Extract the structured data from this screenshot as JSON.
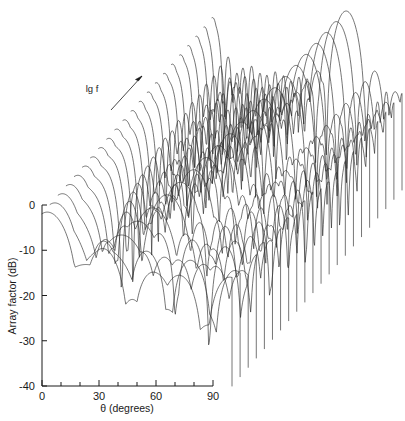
{
  "figure": {
    "title": "",
    "background_color": "#ffffff",
    "line_color": "#2b2b2b",
    "text_color": "#1a1a1a",
    "width": 405,
    "height": 421
  },
  "axes": {
    "x": {
      "label": "θ (degrees)",
      "ticks_major": [
        0,
        30,
        60,
        90
      ],
      "tick_labels": [
        "0",
        "30",
        "60",
        "90"
      ],
      "minor_tick_step": 10,
      "range": [
        0,
        100
      ]
    },
    "y": {
      "label": "Array factor (dB)",
      "ticks_major": [
        0,
        -10,
        -20,
        -30,
        -40
      ],
      "tick_labels": [
        "0",
        "-10",
        "-20",
        "-30",
        "-40"
      ],
      "range": [
        -40,
        0
      ]
    },
    "z": {
      "label": "lg f",
      "arrow": "up-right-arrow",
      "direction": "increasing"
    }
  },
  "chart_data": {
    "type": "line",
    "variant": "waterfall-3d-ridge",
    "title": "",
    "xlabel": "θ (degrees)",
    "ylabel": "Array factor (dB)",
    "zlabel": "lg f",
    "xlim": [
      0,
      100
    ],
    "ylim": [
      -40,
      0
    ],
    "grid": false,
    "legend": "none",
    "n_traces": 22,
    "clip_floor_db": -40,
    "x": [
      0,
      2,
      4,
      6,
      8,
      10,
      12,
      14,
      16,
      18,
      20,
      22,
      24,
      26,
      28,
      30,
      32,
      34,
      36,
      38,
      40,
      42,
      44,
      46,
      48,
      50,
      52,
      54,
      56,
      58,
      60,
      62,
      64,
      66,
      68,
      70,
      72,
      74,
      76,
      78,
      80,
      82,
      84,
      86,
      88,
      90,
      92,
      94,
      96,
      98,
      100
    ],
    "series": [
      {
        "name": "lg f = 0 (front)",
        "lobe_count": 3,
        "main_lobe_theta": 0,
        "first_null_theta": 22
      },
      {
        "name": "lg f = 1",
        "lobe_count": 4,
        "main_lobe_theta": 0,
        "first_null_theta": 21
      },
      {
        "name": "lg f = 2",
        "lobe_count": 5,
        "main_lobe_theta": 0,
        "first_null_theta": 20
      },
      {
        "name": "lg f = 3",
        "lobe_count": 6,
        "main_lobe_theta": 0,
        "first_null_theta": 19
      },
      {
        "name": "lg f = 4",
        "lobe_count": 7,
        "main_lobe_theta": 0,
        "first_null_theta": 18
      },
      {
        "name": "lg f = 5",
        "lobe_count": 8,
        "main_lobe_theta": 0,
        "first_null_theta": 17
      },
      {
        "name": "lg f = 6",
        "lobe_count": 9,
        "main_lobe_theta": 0,
        "first_null_theta": 16
      },
      {
        "name": "lg f = 7",
        "lobe_count": 10,
        "main_lobe_theta": 0,
        "first_null_theta": 15
      },
      {
        "name": "lg f = 8",
        "lobe_count": 11,
        "main_lobe_theta": 0,
        "first_null_theta": 14
      },
      {
        "name": "lg f = 9",
        "lobe_count": 12,
        "main_lobe_theta": 0,
        "first_null_theta": 13
      },
      {
        "name": "lg f = 10",
        "lobe_count": 13,
        "main_lobe_theta": 0,
        "first_null_theta": 12
      },
      {
        "name": "lg f = 11",
        "lobe_count": 14,
        "main_lobe_theta": 0,
        "first_null_theta": 11
      },
      {
        "name": "lg f = 12",
        "lobe_count": 15,
        "main_lobe_theta": 0,
        "first_null_theta": 10
      },
      {
        "name": "lg f = 13",
        "lobe_count": 16,
        "main_lobe_theta": 0,
        "first_null_theta": 10
      },
      {
        "name": "lg f = 14",
        "lobe_count": 17,
        "main_lobe_theta": 0,
        "first_null_theta": 9
      },
      {
        "name": "lg f = 15",
        "lobe_count": 18,
        "main_lobe_theta": 0,
        "first_null_theta": 9
      },
      {
        "name": "lg f = 16",
        "lobe_count": 19,
        "main_lobe_theta": 0,
        "first_null_theta": 8
      },
      {
        "name": "lg f = 17",
        "lobe_count": 20,
        "main_lobe_theta": 0,
        "first_null_theta": 8
      },
      {
        "name": "lg f = 18",
        "lobe_count": 21,
        "main_lobe_theta": 0,
        "first_null_theta": 7
      },
      {
        "name": "lg f = 19",
        "lobe_count": 22,
        "main_lobe_theta": 0,
        "first_null_theta": 7
      },
      {
        "name": "lg f = 20",
        "lobe_count": 23,
        "main_lobe_theta": 0,
        "first_null_theta": 6
      },
      {
        "name": "lg f = 21 (back)",
        "lobe_count": 24,
        "main_lobe_theta": 0,
        "first_null_theta": 6
      }
    ]
  },
  "geometry": {
    "origin_x": 42,
    "origin_y": 205,
    "bottom_y": 386,
    "x_axis_len": 171,
    "depth_dx": 170,
    "depth_dy": -196,
    "n_curves": 22
  }
}
